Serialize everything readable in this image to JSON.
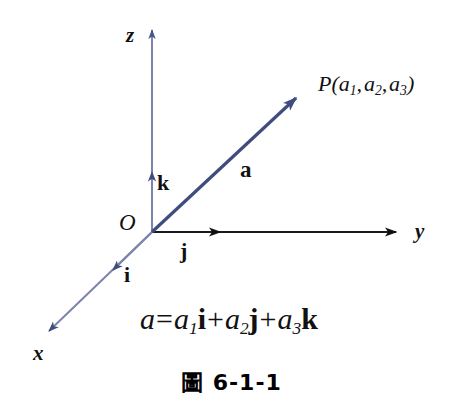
{
  "figure": {
    "caption_prefix": "圖",
    "caption_number": "6-1-1",
    "background_color": "#ffffff",
    "axis_blue": "#7b85ab",
    "vector_blue": "#3f4c7e",
    "axis_black": "#1a1a1a"
  },
  "axes": [
    {
      "id": "z",
      "label": "z",
      "color": "#7b85ab",
      "from": [
        152,
        232
      ],
      "to": [
        152,
        26
      ]
    },
    {
      "id": "y",
      "label": "y",
      "color": "#1a1a1a",
      "from": [
        152,
        232
      ],
      "to": [
        400,
        232
      ]
    },
    {
      "id": "x",
      "label": "x",
      "color": "#7b85ab",
      "from": [
        152,
        232
      ],
      "to": [
        44,
        336
      ]
    }
  ],
  "origin": {
    "label": "O",
    "at": [
      152,
      232
    ]
  },
  "unit_vectors": [
    {
      "id": "k",
      "label": "k",
      "axis": "z",
      "tip": [
        152,
        166
      ],
      "color": "#3f4c7e"
    },
    {
      "id": "j",
      "label": "j",
      "axis": "y",
      "tip": [
        226,
        232
      ],
      "color": "#1a1a1a"
    },
    {
      "id": "i",
      "label": "i",
      "axis": "x",
      "tip": [
        107,
        276
      ],
      "color": "#3f4c7e"
    }
  ],
  "vector_a": {
    "label": "a",
    "color": "#3f4c7e",
    "from": [
      152,
      232
    ],
    "to": [
      302,
      92
    ]
  },
  "point": {
    "name": "P",
    "open_paren": "(",
    "close_paren": ")",
    "comma": ",",
    "coords": [
      {
        "base": "a",
        "sub": "1"
      },
      {
        "base": "a",
        "sub": "2"
      },
      {
        "base": "a",
        "sub": "3"
      }
    ],
    "full_text": "P(a1, a2, a3)"
  },
  "equation": {
    "lhs": "a",
    "equals": "=",
    "plus": "+",
    "terms": [
      {
        "scalar": "a",
        "sub": "1",
        "unit": "i"
      },
      {
        "scalar": "a",
        "sub": "2",
        "unit": "j"
      },
      {
        "scalar": "a",
        "sub": "3",
        "unit": "k"
      }
    ],
    "full_text": "a = a1i + a2j + a3k"
  }
}
